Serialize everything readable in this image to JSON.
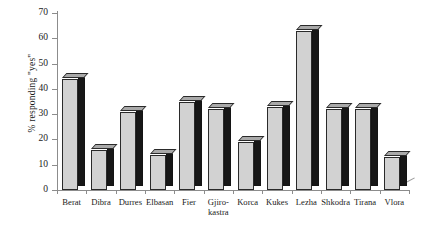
{
  "chart_data": {
    "type": "bar",
    "title": "",
    "subtitle": "",
    "xlabel": "",
    "ylabel": "% responding \"yes\"",
    "ylim": [
      0,
      70
    ],
    "ytick_step": 10,
    "ytick_labels": [
      "0",
      "10",
      "20",
      "30",
      "40",
      "50",
      "60",
      "70"
    ],
    "grid": false,
    "legend": "none",
    "style": "3d-bar",
    "bar_face_color": "#d2d2d2",
    "bar_side_color": "#171717",
    "bar_top_color": "#a9a9a9",
    "bar_edge_color": "#2a2a2a",
    "axis_color": "#8c8c8c",
    "categories": [
      "Berat",
      "Dibra",
      "Durres",
      "Elbasan",
      "Fier",
      "Gjiro-kastra",
      "Korca",
      "Kukes",
      "Lezha",
      "Shkodra",
      "Tirana",
      "Vlora"
    ],
    "category_lines": [
      [
        "Berat"
      ],
      [
        "Dibra"
      ],
      [
        "Durres"
      ],
      [
        "Elbasan"
      ],
      [
        "Fier"
      ],
      [
        "Gjiro-",
        "kastra"
      ],
      [
        "Korca"
      ],
      [
        "Kukes"
      ],
      [
        "Lezha"
      ],
      [
        "Shkodra"
      ],
      [
        "Tirana"
      ],
      [
        "Vlora"
      ]
    ],
    "values": [
      44,
      16,
      31,
      14,
      35,
      32,
      19,
      33,
      63,
      32,
      32,
      13
    ]
  }
}
